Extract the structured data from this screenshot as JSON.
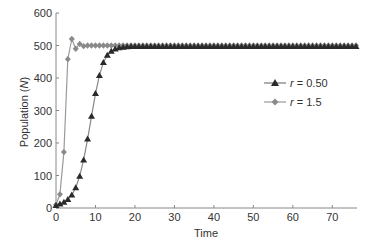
{
  "chart_data": {
    "type": "line",
    "title": "",
    "xlabel": "Time",
    "ylabel": "Population (N)",
    "xlim": [
      0,
      76
    ],
    "ylim": [
      0,
      600
    ],
    "xticks": [
      0,
      10,
      20,
      30,
      40,
      50,
      60,
      70
    ],
    "yticks": [
      0,
      100,
      200,
      300,
      400,
      500,
      600
    ],
    "grid": false,
    "legend_position": "right-middle",
    "series": [
      {
        "name": "r = 0.50",
        "marker": "triangle",
        "color": "#2a2a2a",
        "x": [
          0,
          1,
          2,
          3,
          4,
          5,
          6,
          7,
          8,
          9,
          10,
          11,
          12,
          13,
          14,
          15,
          16,
          17,
          18,
          19,
          20,
          21,
          22,
          23,
          24,
          25,
          26,
          27,
          28,
          29,
          30,
          31,
          32,
          33,
          34,
          35,
          36,
          37,
          38,
          39,
          40,
          41,
          42,
          43,
          44,
          45,
          46,
          47,
          48,
          49,
          50,
          51,
          52,
          53,
          54,
          55,
          56,
          57,
          58,
          59,
          60,
          61,
          62,
          63,
          64,
          65,
          66,
          67,
          68,
          69,
          70,
          71,
          72,
          73,
          74,
          75,
          76
        ],
        "values": [
          8,
          12,
          18,
          26,
          40,
          62,
          98,
          148,
          212,
          282,
          352,
          408,
          448,
          470,
          482,
          489,
          493,
          495,
          496,
          497,
          497,
          497,
          497,
          497,
          497,
          497,
          497,
          497,
          497,
          497,
          497,
          497,
          497,
          497,
          497,
          497,
          497,
          497,
          497,
          497,
          497,
          497,
          497,
          497,
          497,
          497,
          497,
          497,
          497,
          497,
          497,
          497,
          497,
          497,
          497,
          497,
          497,
          497,
          497,
          497,
          497,
          497,
          497,
          497,
          497,
          497,
          497,
          497,
          497,
          497,
          497,
          497,
          497,
          497,
          497,
          497,
          497
        ]
      },
      {
        "name": "r = 1.5",
        "marker": "diamond",
        "color": "#8a8a8a",
        "x": [
          0,
          1,
          2,
          3,
          4,
          5,
          6,
          7,
          8,
          9,
          10,
          11,
          12,
          13,
          14,
          15,
          16,
          17,
          18,
          19,
          20,
          21,
          22,
          23,
          24,
          25,
          26,
          27,
          28,
          29,
          30,
          31,
          32,
          33,
          34,
          35,
          36,
          37,
          38,
          39,
          40,
          41,
          42,
          43,
          44,
          45,
          46,
          47,
          48,
          49,
          50,
          51,
          52,
          53,
          54,
          55,
          56,
          57,
          58,
          59,
          60,
          61,
          62,
          63,
          64,
          65,
          66,
          67,
          68,
          69,
          70,
          71,
          72,
          73,
          74,
          75,
          76
        ],
        "values": [
          10,
          42,
          172,
          458,
          520,
          490,
          505,
          498,
          500,
          500,
          500,
          500,
          500,
          500,
          500,
          500,
          500,
          500,
          500,
          500,
          500,
          500,
          500,
          500,
          500,
          500,
          500,
          500,
          500,
          500,
          500,
          500,
          500,
          500,
          500,
          500,
          500,
          500,
          500,
          500,
          500,
          500,
          500,
          500,
          500,
          500,
          500,
          500,
          500,
          500,
          500,
          500,
          500,
          500,
          500,
          500,
          500,
          500,
          500,
          500,
          500,
          500,
          500,
          500,
          500,
          500,
          500,
          500,
          500,
          500,
          500,
          500,
          500,
          500,
          500,
          500,
          500
        ]
      }
    ]
  },
  "legend": {
    "items": [
      {
        "label": "r = 0.50",
        "r": "r",
        "rest": " = 0.50"
      },
      {
        "label": "r = 1.5",
        "r": "r",
        "rest": " = 1.5"
      }
    ]
  },
  "axes": {
    "xlabel": "Time",
    "ylabel_prefix": "Population (",
    "ylabel_var": "N",
    "ylabel_suffix": ")"
  }
}
